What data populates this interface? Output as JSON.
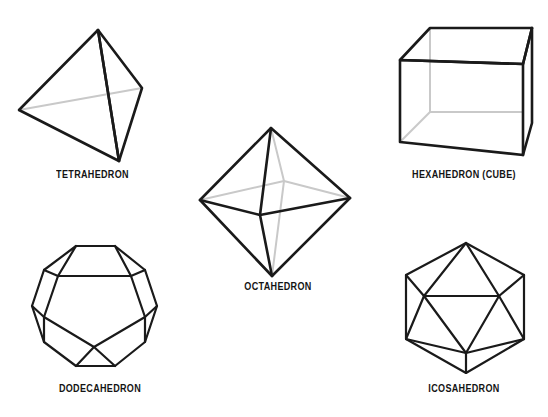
{
  "page": {
    "background_color": "#ffffff",
    "edge_color": "#1a1a1a",
    "hidden_edge_color": "#c9c9c9"
  },
  "figures": [
    {
      "id": "tetrahedron",
      "label": "TETRAHEDRON",
      "faces": 4,
      "vertices": 4,
      "edges": 6,
      "face_shape": "triangle"
    },
    {
      "id": "hexahedron",
      "label": "HEXAHEDRON (CUBE)",
      "faces": 6,
      "vertices": 8,
      "edges": 12,
      "face_shape": "square"
    },
    {
      "id": "octahedron",
      "label": "OCTAHEDRON",
      "faces": 8,
      "vertices": 6,
      "edges": 12,
      "face_shape": "triangle"
    },
    {
      "id": "dodecahedron",
      "label": "DODECAHEDRON",
      "faces": 12,
      "vertices": 20,
      "edges": 30,
      "face_shape": "pentagon"
    },
    {
      "id": "icosahedron",
      "label": "ICOSAHEDRON",
      "faces": 20,
      "vertices": 12,
      "edges": 30,
      "face_shape": "triangle"
    }
  ]
}
